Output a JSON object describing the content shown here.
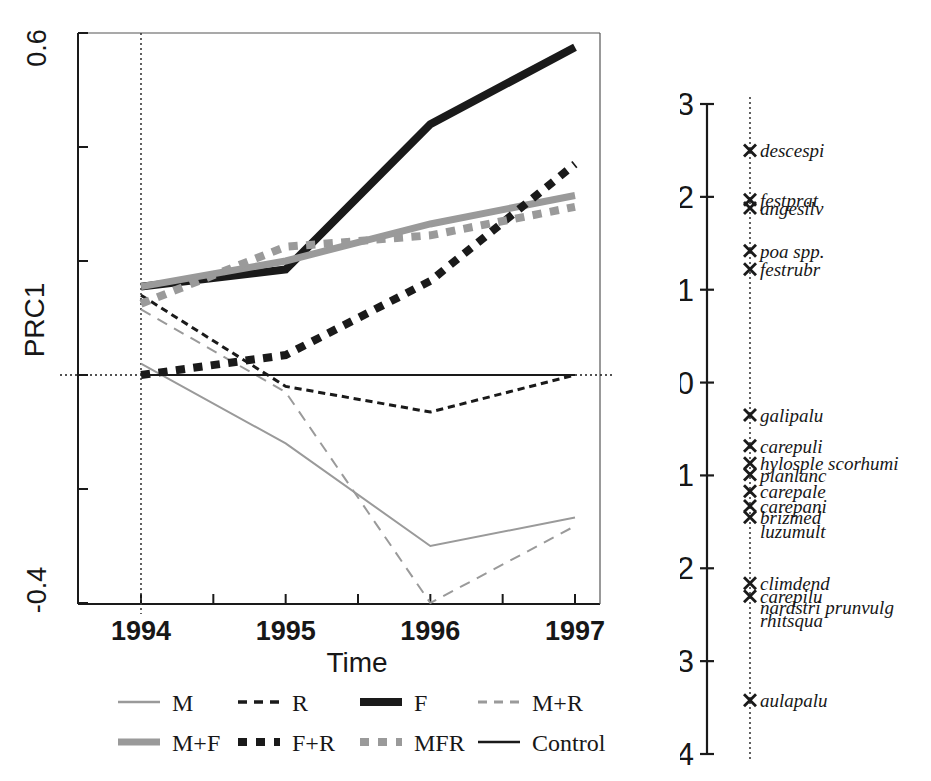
{
  "chart_data": {
    "type": "line",
    "title": "",
    "xlabel": "Time",
    "ylabel": "PRC1",
    "x": [
      1994,
      1995,
      1996,
      1997
    ],
    "xticklabels": [
      "1994",
      "1995",
      "1996",
      "1997"
    ],
    "xlim": [
      1993.5,
      1997.1
    ],
    "ylim": [
      -0.4,
      0.6
    ],
    "yticks": [
      0.6,
      0.4,
      0.2,
      0.0,
      -0.2,
      -0.4
    ],
    "yticklabels_shown": [
      "0.6",
      "-0.4"
    ],
    "grid": false,
    "zero_line": true,
    "legend_position": "bottom",
    "series": [
      {
        "name": "M",
        "style": "solid",
        "color": "#9a9a9a",
        "width": 2,
        "values": [
          0.02,
          -0.12,
          -0.3,
          -0.25
        ]
      },
      {
        "name": "R",
        "style": "dashed",
        "color": "#1a1a1a",
        "width": 3,
        "values": [
          0.14,
          -0.02,
          -0.065,
          0.0
        ]
      },
      {
        "name": "F",
        "style": "solid",
        "color": "#1a1a1a",
        "width": 8,
        "values": [
          0.155,
          0.185,
          0.44,
          0.575
        ]
      },
      {
        "name": "M+R",
        "style": "dashed",
        "color": "#9a9a9a",
        "width": 2,
        "values": [
          0.115,
          -0.03,
          -0.4,
          -0.265
        ]
      },
      {
        "name": "M+F",
        "style": "solid",
        "color": "#9a9a9a",
        "width": 7,
        "values": [
          0.155,
          0.2,
          0.265,
          0.315
        ]
      },
      {
        "name": "F+R",
        "style": "dotted",
        "color": "#1a1a1a",
        "width": 8,
        "values": [
          0.0,
          0.035,
          0.165,
          0.37
        ]
      },
      {
        "name": "MFR",
        "style": "dotted",
        "color": "#9a9a9a",
        "width": 8,
        "values": [
          0.125,
          0.225,
          0.245,
          0.295
        ]
      },
      {
        "name": "Control",
        "style": "solid",
        "color": "#1a1a1a",
        "width": 2,
        "values": [
          0.0,
          0.0,
          0.0,
          0.0
        ]
      }
    ],
    "species_axis": {
      "label": "",
      "ylim": [
        -4,
        3
      ],
      "ticks": [
        3,
        2,
        1,
        0,
        -1,
        -2,
        -3,
        -4
      ],
      "ticklabels": [
        "3",
        "2",
        "1",
        "0",
        "-1",
        "-2",
        "-3",
        "-4"
      ],
      "species": [
        {
          "name": "descespi",
          "value": 2.5,
          "marker": "x",
          "italic": true
        },
        {
          "name": "festprat",
          "value": 1.97,
          "marker": "x",
          "italic": true
        },
        {
          "name": "angesilv",
          "value": 1.88,
          "marker": "x",
          "italic": true
        },
        {
          "name": "poa spp.",
          "value": 1.42,
          "marker": "x",
          "italic": "partial"
        },
        {
          "name": "festrubr",
          "value": 1.22,
          "marker": "x",
          "italic": true
        },
        {
          "name": "galipalu",
          "value": -0.35,
          "marker": "x",
          "italic": true
        },
        {
          "name": "carepuli",
          "value": -0.68,
          "marker": "x",
          "italic": true
        },
        {
          "name": "hylosple scorhumi",
          "value": -0.87,
          "marker": "x",
          "italic": true
        },
        {
          "name": "planlanc",
          "value": -0.99,
          "marker": "x",
          "italic": true
        },
        {
          "name": "carepale",
          "value": -1.17,
          "marker": "x",
          "italic": true
        },
        {
          "name": "carepani",
          "value": -1.33,
          "marker": "x",
          "italic": true
        },
        {
          "name": "brizmed",
          "value": -1.45,
          "marker": "x",
          "italic": true
        },
        {
          "name": "luzumult",
          "value": -1.6,
          "marker": "none",
          "italic": true
        },
        {
          "name": "climdend",
          "value": -2.16,
          "marker": "x",
          "italic": true
        },
        {
          "name": "carepilu",
          "value": -2.3,
          "marker": "x",
          "italic": true
        },
        {
          "name": "nardstri prunvulg",
          "value": -2.42,
          "marker": "none",
          "italic": true
        },
        {
          "name": "rhitsqua",
          "value": -2.56,
          "marker": "none",
          "italic": true
        },
        {
          "name": "aulapalu",
          "value": -3.42,
          "marker": "x",
          "italic": true
        }
      ]
    }
  },
  "axes": {
    "y_top_label": "0.6",
    "y_bottom_label": "-0.4",
    "y_axis_title": "PRC1",
    "x_axis_title": "Time",
    "x_tick_labels": [
      "1994",
      "1995",
      "1996",
      "1997"
    ]
  },
  "legend": {
    "row1": [
      {
        "label": "M",
        "style": "solid-thin-gray"
      },
      {
        "label": "R",
        "style": "dashed-black"
      },
      {
        "label": "F",
        "style": "solid-thick-black"
      },
      {
        "label": "M+R",
        "style": "dashed-gray"
      }
    ],
    "row2": [
      {
        "label": "M+F",
        "style": "solid-thick-gray"
      },
      {
        "label": "F+R",
        "style": "dotted-thick-black"
      },
      {
        "label": "MFR",
        "style": "dotted-thick-gray"
      },
      {
        "label": "Control",
        "style": "solid-thin-black"
      }
    ]
  },
  "species_axis_labels": [
    "3",
    "2",
    "1",
    "0",
    "-1",
    "-2",
    "-3",
    "-4"
  ],
  "colors": {
    "black": "#1a1a1a",
    "gray": "#9a9a9a",
    "background": "#ffffff"
  }
}
